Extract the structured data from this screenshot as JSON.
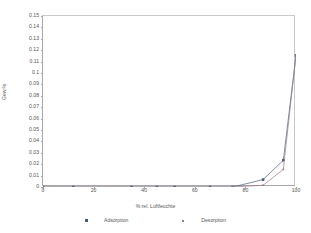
{
  "chart_data": {
    "type": "line",
    "title": "",
    "xlabel": "% rel. Luftfeuchte",
    "ylabel": "Gew.%",
    "xlim": [
      0,
      100
    ],
    "ylim": [
      0,
      0.15
    ],
    "xticks": [
      0,
      20,
      40,
      60,
      80,
      100
    ],
    "xtick_labels": [
      "0",
      "20",
      "40",
      "60",
      "80",
      "100"
    ],
    "yticks": [
      0,
      0.01,
      0.02,
      0.03,
      0.04,
      0.05,
      0.06,
      0.07,
      0.08,
      0.09,
      0.1,
      0.11,
      0.12,
      0.13,
      0.14,
      0.15
    ],
    "ytick_labels": [
      "0",
      "0.01",
      "0.02",
      "0.03",
      "0.04",
      "0.05",
      "0.06",
      "0.07",
      "0.08",
      "0.09",
      "0.1",
      "0.11",
      "0.12",
      "0.13",
      "0.14",
      "0.15"
    ],
    "grid": false,
    "legend_position": "bottom",
    "series": [
      {
        "name": "Adsorption",
        "color": "#4a5a7a",
        "marker": "filled-square",
        "x": [
          0,
          12,
          35,
          45,
          52,
          66,
          75,
          87,
          95,
          100
        ],
        "y": [
          0,
          0,
          0,
          0,
          0,
          0,
          0,
          0.0065,
          0.0235,
          0.1155
        ]
      },
      {
        "name": "Desorption",
        "color": "#9a7a8a",
        "marker": "small-square",
        "x": [
          100,
          95,
          87,
          75,
          0
        ],
        "y": [
          0.1155,
          0.0155,
          0.0015,
          0,
          0
        ]
      }
    ]
  },
  "legend": {
    "adsorption_label": "Adsorption",
    "desorption_label": "Desorption"
  },
  "colors": {
    "adsorption": "#4a5a7a",
    "desorption": "#9a7a8a",
    "axis": "#a8a8a8",
    "text": "#555555"
  }
}
